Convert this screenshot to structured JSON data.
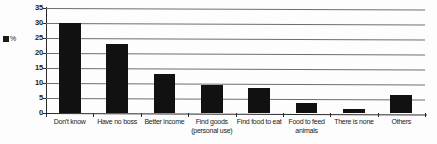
{
  "chart_data": {
    "type": "bar",
    "title": "",
    "xlabel": "",
    "ylabel": "",
    "ylim": [
      0,
      35
    ],
    "ytick_step": 5,
    "yticks": [
      "0",
      "5",
      "10",
      "15",
      "20",
      "25",
      "30",
      "35"
    ],
    "grid": true,
    "grid_orientation": "horizontal",
    "legend_position": "left",
    "legend": [
      {
        "label": "%",
        "color": "#111111",
        "marker": "square"
      }
    ],
    "bar_color": "#111111",
    "categories": [
      "Don't know",
      "Have no boss",
      "Better income",
      "Find goods (personal use)",
      "Find food to eat",
      "Food to feed animals",
      "There is none",
      "Others"
    ],
    "category_lines": [
      [
        "Don't know"
      ],
      [
        "Have no boss"
      ],
      [
        "Better income"
      ],
      [
        "Find goods",
        "(personal use)"
      ],
      [
        "Find food to eat"
      ],
      [
        "Food to feed",
        "animals"
      ],
      [
        "There is none"
      ],
      [
        "Others"
      ]
    ],
    "values": [
      30,
      23,
      13,
      9.3,
      8.3,
      3.5,
      1.5,
      6
    ],
    "series": [
      {
        "name": "%",
        "values": [
          30,
          23,
          13,
          9.3,
          8.3,
          3.5,
          1.5,
          6
        ]
      }
    ]
  }
}
